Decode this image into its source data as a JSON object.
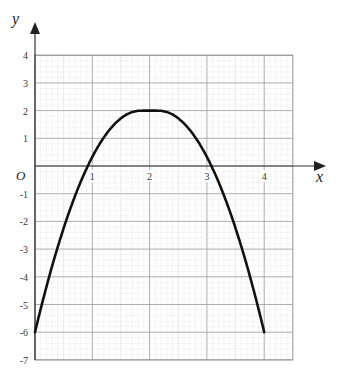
{
  "chart_data": {
    "type": "line",
    "title": "",
    "xlabel": "x",
    "ylabel": "y",
    "origin_label": "O",
    "xlim": [
      0,
      4.5
    ],
    "ylim": [
      -7,
      4
    ],
    "grid": true,
    "x_ticks": [
      "1",
      "2",
      "3",
      "4"
    ],
    "y_ticks": [
      "4",
      "3",
      "2",
      "1",
      "-1",
      "-2",
      "-3",
      "-4",
      "-5",
      "-6",
      "-7"
    ],
    "series": [
      {
        "name": "y = -2(x-2)^2 + 2",
        "x": [
          0,
          0.5,
          1,
          1.5,
          1.8,
          2,
          2.2,
          2.5,
          3,
          3.5,
          4
        ],
        "y": [
          -6,
          -2.5,
          0,
          1.5,
          2,
          2,
          2,
          1.5,
          0,
          -2.5,
          -6
        ]
      }
    ]
  }
}
